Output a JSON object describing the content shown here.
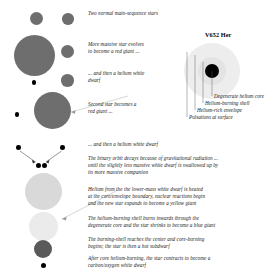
{
  "figure": {
    "title": "V652 Her",
    "bg_color": "#ffffff"
  },
  "palette": {
    "red_giant": "#6e6e6e",
    "main_sequence": "#6e6e6e",
    "white_dwarf": "#000000",
    "yellow_giant": "#d9d9d9",
    "blue_giant": "#ebebeb",
    "subdwarf": "#5a5a5a",
    "envelope": "#ededed",
    "core": "#000000",
    "text": "#1a1a1a"
  },
  "captions": {
    "c1": "Two normal main-sequence stars",
    "c2": "More massive star evolves",
    "c2b": "to become a red giant ...",
    "c3": "... and then a helium white",
    "c3b": "dwarf",
    "c4": "Second star becomes a",
    "c4b": "red giant ...",
    "c5": "... and then a helium white dwarf",
    "c6": "The binary orbit decays because of gravitational radiation ...",
    "c6b": "until the slightly less massive white dwarf is swallowed up by",
    "c6c": "its more massive companion",
    "c7": "Helium from the the lower-mass white dwarf is heated",
    "c7b": "at the core/envelope boundary, nuclear reactions begin",
    "c7c": "and the new star expands to become a yellow giant",
    "c8": "The helium-burning shell burns inwards through the",
    "c8b": "degenerate core and the star shrinks to become a blue giant",
    "c9": "The burning-shell reaches the center and core-burning",
    "c9b": "begins; the star is then a hot subdwarf",
    "c10": "After core helium-burning, the star contracts to become a",
    "c10b": "carbon/oxygen white dwarf"
  },
  "star_labels": [
    "Degenerate helium core",
    "Helium-burning shell",
    "Helium-rich envelope",
    "Pulsations at surface"
  ],
  "stages": [
    {
      "name": "main-sequence-pair-primary",
      "r": 5.5,
      "color": "#6e6e6e"
    },
    {
      "name": "main-sequence-pair-secondary",
      "r": 5.0,
      "color": "#6e6e6e"
    },
    {
      "name": "red-giant-primary",
      "r": 18.5,
      "color": "#6e6e6e"
    },
    {
      "name": "companion-ms-1",
      "r": 5.5,
      "color": "#6e6e6e"
    },
    {
      "name": "white-dwarf-primary",
      "r": 2.0,
      "color": "#000000"
    },
    {
      "name": "companion-ms-2",
      "r": 5.5,
      "color": "#6e6e6e"
    },
    {
      "name": "red-giant-secondary",
      "r": 16.5,
      "color": "#6e6e6e"
    },
    {
      "name": "white-dwarf-pair-left",
      "r": 2.2,
      "color": "#000000"
    },
    {
      "name": "white-dwarf-pair-right",
      "r": 2.2,
      "color": "#000000"
    },
    {
      "name": "merged-white-dwarfs",
      "r": 2.4,
      "color": "#000000"
    },
    {
      "name": "yellow-giant",
      "r": 16.5,
      "color": "#d9d9d9"
    },
    {
      "name": "blue-giant",
      "r": 13.0,
      "color": "#ebebeb"
    },
    {
      "name": "hot-subdwarf",
      "r": 8.5,
      "color": "#5a5a5a"
    },
    {
      "name": "carbon-oxygen-white-dwarf",
      "r": 2.4,
      "color": "#000000"
    }
  ]
}
